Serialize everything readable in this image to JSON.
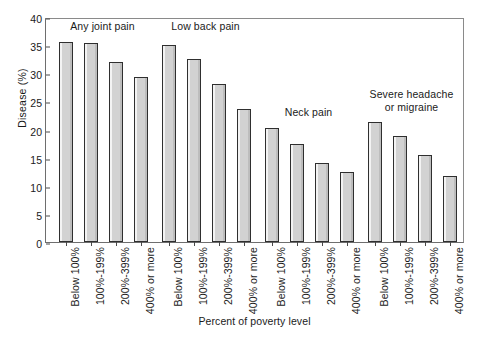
{
  "chart": {
    "ylabel": "Disease (%)",
    "xlabel": "Percent of poverty level"
  },
  "chart_data": {
    "type": "bar",
    "title": "",
    "xlabel": "Percent of poverty level",
    "ylabel": "Disease (%)",
    "ylim": [
      0,
      40
    ],
    "yticks": [
      0,
      5,
      10,
      15,
      20,
      25,
      30,
      35,
      40
    ],
    "ytick_labels": [
      "0",
      "5",
      "10",
      "15",
      "20",
      "25",
      "30",
      "35",
      "40"
    ],
    "grid": false,
    "legend": "none",
    "bar_fill_color": "#d2d2d2",
    "bar_edge_color": "#2f2f2f",
    "categories": [
      "Below 100%",
      "100%-199%",
      "200%-399%",
      "400% or more"
    ],
    "groups": [
      {
        "name": "Any joint pain",
        "label_lines": [
          "Any joint pain"
        ],
        "values": [
          35.5,
          35.3,
          32.0,
          29.4
        ]
      },
      {
        "name": "Low back pain",
        "label_lines": [
          "Low back pain"
        ],
        "values": [
          35.1,
          32.5,
          28.1,
          23.6
        ]
      },
      {
        "name": "Neck pain",
        "label_lines": [
          "Neck pain"
        ],
        "values": [
          20.2,
          17.4,
          14.1,
          12.5
        ]
      },
      {
        "name": "Severe headache or migraine",
        "label_lines": [
          "Severe headache",
          "or migraine"
        ],
        "values": [
          21.3,
          18.8,
          15.5,
          11.8
        ]
      }
    ]
  }
}
